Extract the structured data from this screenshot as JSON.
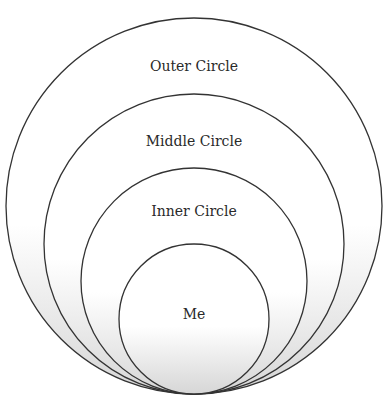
{
  "diagram": {
    "type": "concentric-tangent-circles",
    "circles": [
      {
        "label": "Outer Circle"
      },
      {
        "label": "Middle Circle"
      },
      {
        "label": "Inner Circle"
      },
      {
        "label": "Me"
      }
    ],
    "colors": {
      "stroke": "#333333",
      "fill_top": "#ffffff",
      "fill_bottom": "#dcdcdc"
    }
  }
}
